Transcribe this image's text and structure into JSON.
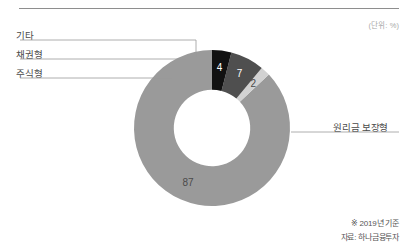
{
  "unit_note": "(단위: %)",
  "labels": {
    "etc": "기타",
    "bond": "채권형",
    "stock": "주식형",
    "principal_guaranteed": "원리금 보장형"
  },
  "footer": {
    "basis": "※ 2019년 기준",
    "source": "자료: 하나금융투자"
  },
  "values": {
    "principal_guaranteed": "87",
    "stock": "2",
    "bond": "7",
    "etc": "4"
  },
  "chart_data": {
    "type": "pie",
    "title": "",
    "subtitle": "",
    "unit": "%",
    "donut": true,
    "inner_radius_ratio": 0.49,
    "start_angle_deg": -90,
    "direction": "counterclockwise",
    "categories": [
      "원리금 보장형",
      "주식형",
      "채권형",
      "기타"
    ],
    "values": [
      87,
      2,
      7,
      4
    ],
    "colors": [
      "#9a9a9a",
      "#d2d2d2",
      "#4f4f4f",
      "#111111"
    ],
    "value_label_colors": [
      "#4a4a4a",
      "#4a4a4a",
      "#ffffff",
      "#ffffff"
    ],
    "legend": "leader-lines",
    "legend_position": "left-and-right",
    "grid": false,
    "xlabel": "",
    "ylabel": ""
  }
}
